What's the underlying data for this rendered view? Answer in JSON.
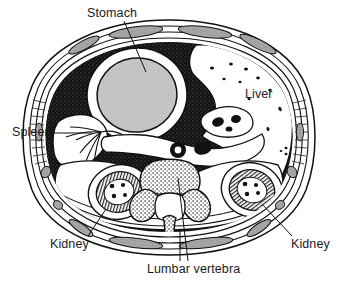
{
  "figure": {
    "type": "anatomical-cross-section",
    "background_color": "#ffffff",
    "ink_color": "#111111"
  },
  "labels": [
    {
      "id": "stomach",
      "text": "Stomach",
      "x": 87,
      "y": 6
    },
    {
      "id": "spleen",
      "text": "Spleen",
      "x": 12,
      "y": 125
    },
    {
      "id": "liver",
      "text": "Liver",
      "x": 245,
      "y": 87
    },
    {
      "id": "kidney_left",
      "text": "Kidney",
      "x": 50,
      "y": 237
    },
    {
      "id": "kidney_right",
      "text": "Kidney",
      "x": 291,
      "y": 237
    },
    {
      "id": "lumbar_vertebra",
      "text": "Lumbar vertebra",
      "x": 147,
      "y": 262
    }
  ],
  "structures": {
    "body_wall": "layered abdominal wall with concentric bands",
    "stomach": "light gray stippled oval, upper left quadrant",
    "liver": "large white region, right side, with scattered vessel dots",
    "spleen": "branching hilar vessels, left lateral",
    "kidney_left": "rounded organ with radial cortex hatching and central calyces",
    "kidney_right": "rounded organ with radial cortex hatching and central calyces",
    "lumbar_vertebra": "stippled trabecular bone, centre posterior",
    "aorta": "round vessel anterior to vertebra",
    "inferior_vena_cava": "oval vessel anterior to vertebra",
    "peritoneal_fat": "dark stippled field surrounding viscera"
  },
  "colors": {
    "ink": "#111111",
    "organ_fill_light": "#bdbdbd",
    "fat_dark": "#1c1c1c",
    "muscle_band": "#9a9a9a",
    "white": "#ffffff"
  }
}
